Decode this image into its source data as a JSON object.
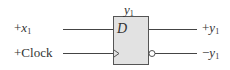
{
  "diagram": {
    "type": "D flip-flop",
    "block": {
      "title": "y",
      "title_sub": "1",
      "input_label": "D",
      "fill": "#e2e2e2",
      "stroke": "#555555"
    },
    "inputs": [
      {
        "sign": "+",
        "name": "x",
        "sub": "1"
      },
      {
        "sign": "+",
        "name": "Clock",
        "sub": ""
      }
    ],
    "outputs": [
      {
        "sign": "+",
        "name": "y",
        "sub": "1"
      },
      {
        "sign": "−",
        "name": "y",
        "sub": "1"
      }
    ]
  }
}
